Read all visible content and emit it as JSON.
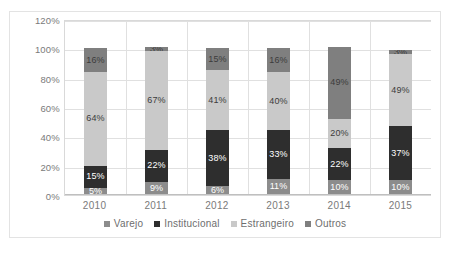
{
  "chart_data": {
    "type": "bar",
    "subtype": "stacked-column-100",
    "title": "",
    "subtitle": "",
    "xlabel": "",
    "ylabel": "",
    "categories": [
      "2010",
      "2011",
      "2012",
      "2013",
      "2014",
      "2015"
    ],
    "ylim": [
      0,
      120
    ],
    "yticks": [
      "0%",
      "20%",
      "40%",
      "60%",
      "80%",
      "100%",
      "120%"
    ],
    "ytick_values": [
      0,
      20,
      40,
      60,
      80,
      100,
      120
    ],
    "grid": true,
    "legend_position": "bottom",
    "value_format": "percent",
    "series": [
      {
        "name": "Varejo",
        "color": "#8c8c8c",
        "values": [
          5,
          9,
          6,
          11,
          10,
          10
        ],
        "labels": [
          "5%",
          "9%",
          "6%",
          "11%",
          "10%",
          "10%"
        ],
        "label_color": "light"
      },
      {
        "name": "Institucional",
        "color": "#2e2e2e",
        "values": [
          15,
          22,
          38,
          33,
          22,
          37
        ],
        "labels": [
          "15%",
          "22%",
          "38%",
          "33%",
          "22%",
          "37%"
        ],
        "label_color": "light"
      },
      {
        "name": "Estrangeiro",
        "color": "#c9c9c9",
        "values": [
          64,
          67,
          41,
          40,
          20,
          49
        ],
        "labels": [
          "64%",
          "67%",
          "41%",
          "40%",
          "20%",
          "49%"
        ],
        "label_color": "dark"
      },
      {
        "name": "Outros",
        "color": "#7f7f7f",
        "values": [
          16,
          3,
          15,
          16,
          49,
          3
        ],
        "labels": [
          "16%",
          "3%",
          "15%",
          "16%",
          "49%",
          "3%"
        ],
        "label_color": "dark"
      }
    ],
    "totals": [
      "100%",
      "101%",
      "100%",
      "100%",
      "101%",
      "99%"
    ]
  },
  "colors": {
    "plot_border": "#d9d9d9",
    "gridline": "#e0e0e0",
    "frame_border": "#e3e3e3",
    "tick_text": "#7a7a7a",
    "legend_text": "#6e6e6e",
    "background": "#ffffff"
  }
}
